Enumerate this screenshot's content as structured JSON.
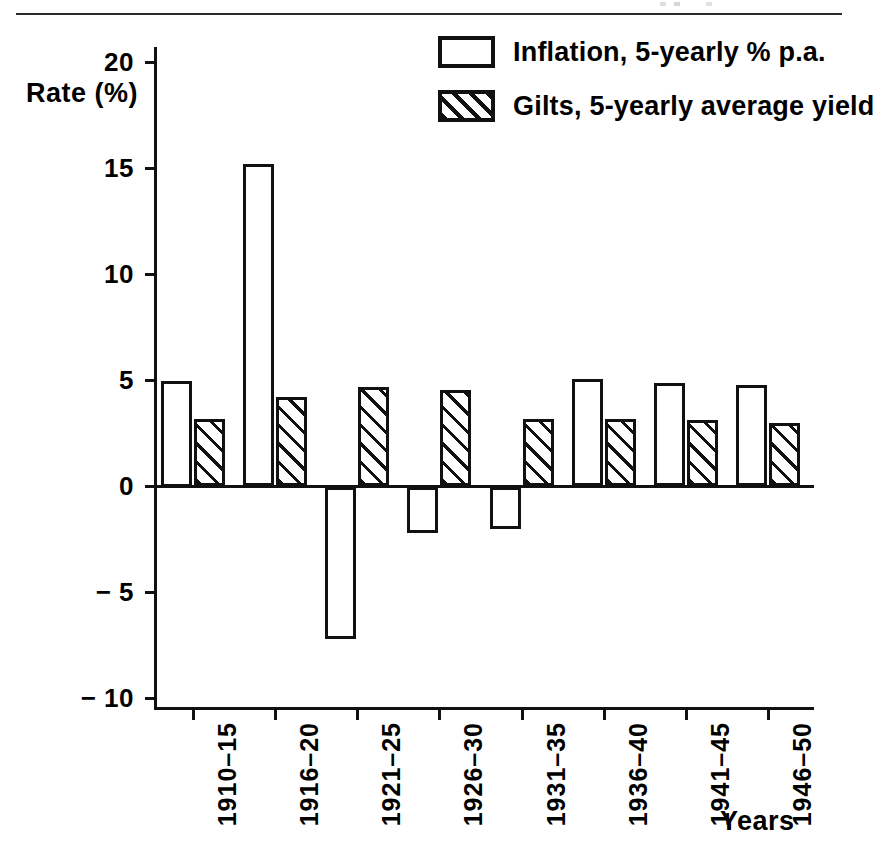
{
  "figure": {
    "rate_axis_label": "Rate (%)",
    "years_axis_label": "Years"
  },
  "legend": {
    "entries": [
      {
        "key": "inflation",
        "label": "Inflation, 5-yearly % p.a.",
        "swatch": "open-box"
      },
      {
        "key": "gilts",
        "label": "Gilts, 5-yearly average yield",
        "swatch": "hatched-box"
      }
    ]
  },
  "colors": {
    "ink": "#111111",
    "paper": "#ffffff",
    "rule": "#2b2b2b"
  },
  "chart_data": {
    "type": "bar",
    "title": "",
    "xlabel": "Years",
    "ylabel": "Rate (%)",
    "ylim": [
      -10,
      20
    ],
    "yticks": [
      20,
      15,
      10,
      5,
      0,
      -5,
      -10
    ],
    "ytick_labels": [
      "20",
      "15",
      "10",
      "5",
      "0",
      "− 5",
      "− 10"
    ],
    "grid": false,
    "legend_position": "top-right",
    "categories": [
      "1910–15",
      "1916–20",
      "1921–25",
      "1926–30",
      "1931–35",
      "1936–40",
      "1941–45",
      "1946–50"
    ],
    "series": [
      {
        "name": "Inflation, 5-yearly % p.a.",
        "style": "open",
        "values": [
          5.0,
          15.2,
          -7.2,
          -2.2,
          -2.0,
          5.05,
          4.9,
          4.8
        ]
      },
      {
        "name": "Gilts, 5-yearly average yield",
        "style": "hatched",
        "values": [
          3.2,
          4.2,
          4.7,
          4.55,
          3.2,
          3.2,
          3.15,
          3.0
        ]
      }
    ]
  }
}
